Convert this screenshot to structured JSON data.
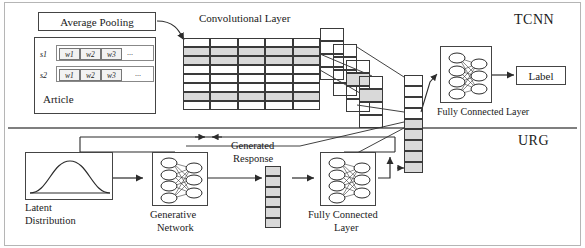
{
  "figure": {
    "sections": {
      "top_label": "TCNN",
      "bottom_label": "URG"
    },
    "tcnn": {
      "average_pooling_label": "Average Pooling",
      "article_label": "Article",
      "sentences": [
        {
          "name": "s1",
          "words": [
            "w1",
            "w2",
            "w3"
          ],
          "ellipsis": "..."
        },
        {
          "name": "s2",
          "words": [
            "w1",
            "w2",
            "w3"
          ],
          "ellipsis": "..."
        }
      ],
      "conv_layer_label": "Convolutional Layer",
      "conv_grid": {
        "cols": 5,
        "rows": 8,
        "shaded_rows": [
          1,
          2,
          6
        ]
      },
      "feature_stacks": 4,
      "feature_stack_cells": 4,
      "fully_connected_label": "Fully Connected Layer",
      "fc_nodes_in": 4,
      "fc_nodes_out": 3,
      "output_label": "Label"
    },
    "urg": {
      "latent_label_line1": "Latent",
      "latent_label_line2": "Distribution",
      "generative_label_line1": "Generative",
      "generative_label_line2": "Network",
      "gen_nodes_in": 4,
      "gen_nodes_out": 3,
      "generated_response_line1": "Generated",
      "generated_response_line2": "Response",
      "response_cells": 6,
      "fully_connected_label_line1": "Fully Connected",
      "fully_connected_label_line2": "Layer",
      "fc_nodes_in": 4,
      "fc_nodes_out": 3
    },
    "shared_vector": {
      "cells": 9
    },
    "colors": {
      "stroke": "#3a3a3a",
      "shade": "#d9d9d9",
      "text": "#1a1a1a",
      "divider": "#555555",
      "frame": "#9a9a9a"
    }
  }
}
